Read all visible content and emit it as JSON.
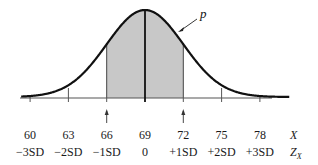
{
  "chart_data": {
    "type": "area",
    "title": "",
    "distribution": {
      "mean": 69,
      "sd": 3
    },
    "curve_label": "p",
    "shaded_range": {
      "from": 66,
      "to": 72,
      "color": "#c8c8c8"
    },
    "x_ticks": [
      60,
      63,
      66,
      69,
      72,
      75,
      78
    ],
    "x_tick_labels": [
      "60",
      "63",
      "66",
      "69",
      "72",
      "75",
      "78"
    ],
    "z_tick_labels": [
      "−3SD",
      "−2SD",
      "−1SD",
      "0",
      "+1SD",
      "+2SD",
      "+3SD"
    ],
    "xlabel": "X",
    "zlabel": "Z",
    "zlabel_subscript": "X",
    "arrow_markers": [
      66,
      72
    ],
    "xlim": [
      59.3,
      80.3
    ],
    "grid": false,
    "legend": "none"
  },
  "colors": {
    "curve": "#111111",
    "axis": "#555555",
    "shade": "#c8c8c8"
  }
}
